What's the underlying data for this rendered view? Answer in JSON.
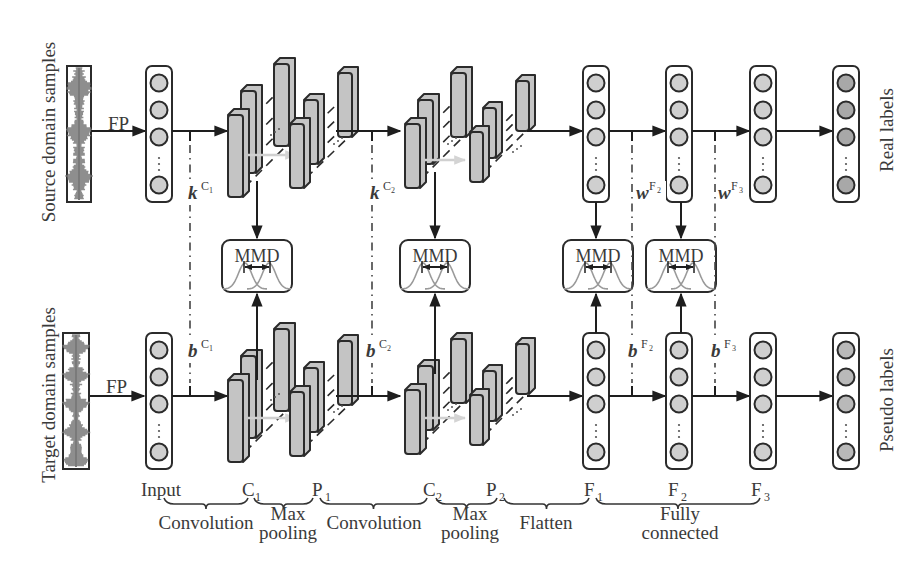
{
  "diagram": {
    "colors": {
      "stroke": "#2b2b2b",
      "node_fill": "#cfcfcf",
      "node_fill_real": "#a8a8a8",
      "node_fill_pseudo": "#b9b9b9",
      "fmap_fill": "#c4c4c4",
      "signal": "#7a7a7a",
      "gauss": "#9a9a9a",
      "ghost_arrow": "#d0d0d0"
    },
    "side_labels": {
      "source": "Source domain samples",
      "target": "Target domain samples",
      "real": "Real labels",
      "pseudo": "Pseudo labels"
    },
    "fp_label": "FP",
    "mmd_label": "MMD",
    "params": {
      "k_c1": {
        "base": "k",
        "sup": "C",
        "sub": "1"
      },
      "k_c2": {
        "base": "k",
        "sup": "C",
        "sub": "2"
      },
      "w_f2": {
        "base": "w",
        "sup": "F",
        "sub": "2"
      },
      "w_f3": {
        "base": "w",
        "sup": "F",
        "sub": "3"
      },
      "b_c1": {
        "base": "b",
        "sup": "C",
        "sub": "1"
      },
      "b_c2": {
        "base": "b",
        "sup": "C",
        "sub": "2"
      },
      "b_f2": {
        "base": "b",
        "sup": "F",
        "sub": "2"
      },
      "b_f3": {
        "base": "b",
        "sup": "F",
        "sub": "3"
      }
    },
    "layer_labels": [
      {
        "id": "input",
        "text": "Input",
        "sub": ""
      },
      {
        "id": "c1",
        "text": "C",
        "sub": "1"
      },
      {
        "id": "p1",
        "text": "P",
        "sub": "1"
      },
      {
        "id": "c2",
        "text": "C",
        "sub": "2"
      },
      {
        "id": "p2",
        "text": "P",
        "sub": "2"
      },
      {
        "id": "f1",
        "text": "F",
        "sub": "1"
      },
      {
        "id": "f2",
        "text": "F",
        "sub": "2"
      },
      {
        "id": "f3",
        "text": "F",
        "sub": "3"
      }
    ],
    "stages": [
      {
        "id": "conv1",
        "lines": [
          "Convolution"
        ]
      },
      {
        "id": "pool1",
        "lines": [
          "Max",
          "pooling"
        ]
      },
      {
        "id": "conv2",
        "lines": [
          "Convolution"
        ]
      },
      {
        "id": "pool2",
        "lines": [
          "Max",
          "pooling"
        ]
      },
      {
        "id": "flatten",
        "lines": [
          "Flatten"
        ]
      },
      {
        "id": "fc",
        "lines": [
          "Fully",
          "connected"
        ]
      }
    ]
  }
}
